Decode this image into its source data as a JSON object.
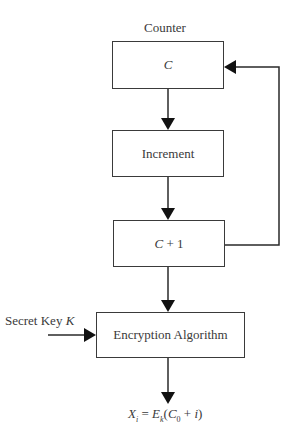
{
  "diagram": {
    "top_label": "Counter",
    "nodes": [
      {
        "id": "counter",
        "label": "C"
      },
      {
        "id": "increment",
        "label": "Increment"
      },
      {
        "id": "c_plus_1",
        "label_var": "C",
        "label_rest": " + 1"
      },
      {
        "id": "encryption",
        "label": "Encryption Algorithm"
      }
    ],
    "secret_key": {
      "prefix": "Secret Key ",
      "var": "K"
    },
    "output": {
      "X": "X",
      "X_sub": "i",
      "eq": " = ",
      "E": "E",
      "E_sub": "k",
      "open": "(",
      "C": "C",
      "C_sub": "0",
      "plus": " + ",
      "i": "i",
      "close": ")"
    },
    "edges": [
      {
        "from": "counter",
        "to": "increment"
      },
      {
        "from": "increment",
        "to": "c_plus_1"
      },
      {
        "from": "c_plus_1",
        "to": "counter",
        "type": "feedback"
      },
      {
        "from": "c_plus_1",
        "to": "encryption"
      },
      {
        "from": "secret_key",
        "to": "encryption"
      },
      {
        "from": "encryption",
        "to": "output"
      }
    ]
  }
}
